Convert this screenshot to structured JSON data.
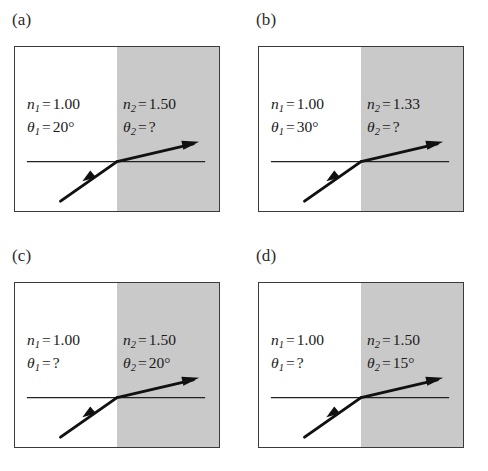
{
  "figure": {
    "type": "physics-refraction-diagram-set",
    "panel_count": 4,
    "colors": {
      "medium_left_fill": "#ffffff",
      "medium_right_fill": "#c9c9c9",
      "box_border": "#3a3a3a",
      "ray": "#111111",
      "reference_line": "#222222",
      "text": "#1a1a1a",
      "background": "#ffffff"
    },
    "common": {
      "n1_symbol": "n",
      "n1_subscript": "1",
      "n2_symbol": "n",
      "n2_subscript": "2",
      "theta1_symbol": "θ",
      "theta1_subscript": "1",
      "theta2_symbol": "θ",
      "theta2_subscript": "2",
      "equals": "=",
      "unknown": "?",
      "degree": "°"
    }
  },
  "panels": [
    {
      "id": "a",
      "label": "(a)",
      "n1_value": "1.00",
      "theta1_value": "20°",
      "n2_value": "1.50",
      "theta2_value": "?"
    },
    {
      "id": "b",
      "label": "(b)",
      "n1_value": "1.00",
      "theta1_value": "30°",
      "n2_value": "1.33",
      "theta2_value": "?"
    },
    {
      "id": "c",
      "label": "(c)",
      "n1_value": "1.00",
      "theta1_value": "?",
      "n2_value": "1.50",
      "theta2_value": "20°"
    },
    {
      "id": "d",
      "label": "(d)",
      "n1_value": "1.00",
      "theta1_value": "?",
      "n2_value": "1.50",
      "theta2_value": "15°"
    }
  ]
}
